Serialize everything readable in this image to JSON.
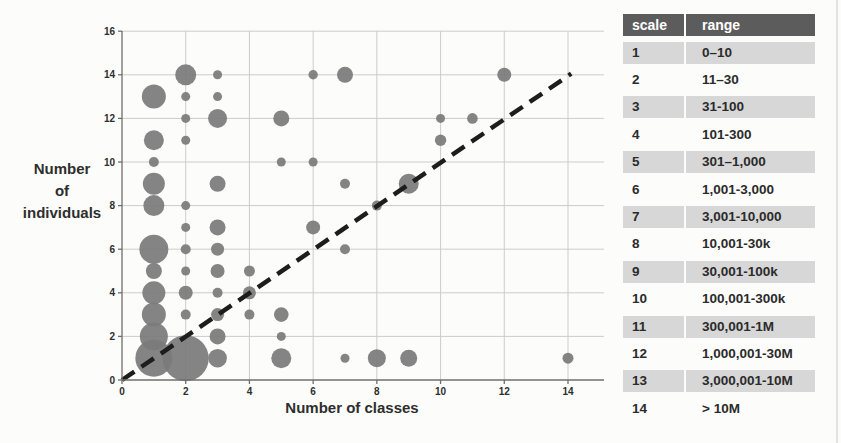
{
  "chart_data": {
    "type": "scatter",
    "subtype": "bubble",
    "title": "",
    "xlabel": "Number of classes",
    "ylabel": "Number of individuals",
    "ylabel_lines": [
      "Number",
      "of",
      "individuals"
    ],
    "xlim": [
      0,
      15.1
    ],
    "ylim": [
      0,
      16
    ],
    "x_ticks": [
      0,
      2,
      4,
      6,
      8,
      10,
      12,
      14
    ],
    "y_ticks": [
      0,
      2,
      4,
      6,
      8,
      10,
      12,
      14,
      16
    ],
    "grid": true,
    "size_encoding": "bubble size = abundance scale (see scale/range table)",
    "reference_line": {
      "style": "dashed",
      "from": [
        0,
        0
      ],
      "to": [
        14.1,
        14.05
      ]
    },
    "points": [
      {
        "x": 1,
        "y": 1,
        "r": 18.5
      },
      {
        "x": 1,
        "y": 2,
        "r": 14
      },
      {
        "x": 1,
        "y": 3,
        "r": 12
      },
      {
        "x": 1,
        "y": 4,
        "r": 11.5
      },
      {
        "x": 1,
        "y": 5,
        "r": 8
      },
      {
        "x": 1,
        "y": 6,
        "r": 14.5
      },
      {
        "x": 1,
        "y": 8,
        "r": 10.5
      },
      {
        "x": 1,
        "y": 9,
        "r": 11
      },
      {
        "x": 1,
        "y": 10,
        "r": 5
      },
      {
        "x": 1,
        "y": 11,
        "r": 10
      },
      {
        "x": 1,
        "y": 13,
        "r": 12
      },
      {
        "x": 2,
        "y": 1,
        "r": 23
      },
      {
        "x": 2,
        "y": 3,
        "r": 5
      },
      {
        "x": 2,
        "y": 4,
        "r": 7
      },
      {
        "x": 2,
        "y": 5,
        "r": 4.5
      },
      {
        "x": 2,
        "y": 6,
        "r": 5
      },
      {
        "x": 2,
        "y": 7,
        "r": 4.5
      },
      {
        "x": 2,
        "y": 8,
        "r": 4.5
      },
      {
        "x": 2,
        "y": 11,
        "r": 4.5
      },
      {
        "x": 2,
        "y": 12,
        "r": 4.5
      },
      {
        "x": 2,
        "y": 13,
        "r": 4.5
      },
      {
        "x": 2,
        "y": 14,
        "r": 10.5
      },
      {
        "x": 3,
        "y": 1,
        "r": 9.3
      },
      {
        "x": 3,
        "y": 2,
        "r": 8
      },
      {
        "x": 3,
        "y": 3,
        "r": 6.5
      },
      {
        "x": 3,
        "y": 4,
        "r": 5
      },
      {
        "x": 3,
        "y": 5,
        "r": 7
      },
      {
        "x": 3,
        "y": 6,
        "r": 6.5
      },
      {
        "x": 3,
        "y": 7,
        "r": 8
      },
      {
        "x": 3,
        "y": 9,
        "r": 8
      },
      {
        "x": 3,
        "y": 12,
        "r": 9.5
      },
      {
        "x": 3,
        "y": 13,
        "r": 4.5
      },
      {
        "x": 3,
        "y": 14,
        "r": 4.5
      },
      {
        "x": 4,
        "y": 3,
        "r": 5
      },
      {
        "x": 4,
        "y": 4,
        "r": 6.5
      },
      {
        "x": 4,
        "y": 5,
        "r": 5.5
      },
      {
        "x": 5,
        "y": 1,
        "r": 10
      },
      {
        "x": 5,
        "y": 2,
        "r": 4.5
      },
      {
        "x": 5,
        "y": 3,
        "r": 7.3
      },
      {
        "x": 5,
        "y": 10,
        "r": 4.5
      },
      {
        "x": 5,
        "y": 12,
        "r": 8
      },
      {
        "x": 6,
        "y": 7,
        "r": 7
      },
      {
        "x": 6,
        "y": 10,
        "r": 4.5
      },
      {
        "x": 6,
        "y": 14,
        "r": 4.7
      },
      {
        "x": 7,
        "y": 1,
        "r": 4.5
      },
      {
        "x": 7,
        "y": 6,
        "r": 5
      },
      {
        "x": 7,
        "y": 9,
        "r": 5
      },
      {
        "x": 7,
        "y": 14,
        "r": 8
      },
      {
        "x": 8,
        "y": 1,
        "r": 9
      },
      {
        "x": 8,
        "y": 8,
        "r": 5
      },
      {
        "x": 9,
        "y": 1,
        "r": 8.5
      },
      {
        "x": 9,
        "y": 9,
        "r": 10
      },
      {
        "x": 10,
        "y": 11,
        "r": 5.7
      },
      {
        "x": 10,
        "y": 12,
        "r": 4.5
      },
      {
        "x": 11,
        "y": 12,
        "r": 5.3
      },
      {
        "x": 12,
        "y": 14,
        "r": 7
      },
      {
        "x": 14,
        "y": 1,
        "r": 5.5
      }
    ],
    "colors": {
      "bubble": "#7b7b7b",
      "grid": "#cccccc",
      "axis": "#6f6f6f",
      "dash_line": "#1d1d1d",
      "text": "#2e2e2e"
    }
  },
  "table": {
    "headers": [
      "scale",
      "range"
    ],
    "rows": [
      {
        "scale": "1",
        "range": "0–10"
      },
      {
        "scale": "2",
        "range": "11–30"
      },
      {
        "scale": "3",
        "range": "31-100"
      },
      {
        "scale": "4",
        "range": "101-300"
      },
      {
        "scale": "5",
        "range": "301–1,000"
      },
      {
        "scale": "6",
        "range": "1,001-3,000"
      },
      {
        "scale": "7",
        "range": "3,001-10,000"
      },
      {
        "scale": "8",
        "range": "10,001-30k"
      },
      {
        "scale": "9",
        "range": "30,001-100k"
      },
      {
        "scale": "10",
        "range": "100,001-300k"
      },
      {
        "scale": "11",
        "range": "300,001-1M"
      },
      {
        "scale": "12",
        "range": "1,000,001-30M"
      },
      {
        "scale": "13",
        "range": "3,000,001-10M"
      },
      {
        "scale": "14",
        "range": "> 10M"
      }
    ],
    "colors": {
      "header_bg": "#5c5c5c",
      "header_text": "#ffffff",
      "row_shaded": "#d7d7d7",
      "row_plain": "#fcfcfa",
      "text": "#2b2b2b"
    }
  }
}
